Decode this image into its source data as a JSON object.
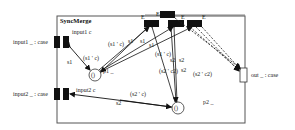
{
  "diagram": {
    "title": "SyncMerge",
    "ports": {
      "input1": {
        "outer_label": "input1 _ : case",
        "inner_label": "input1 c"
      },
      "input2": {
        "outer_label": "input2 _ : case",
        "inner_label": "input2 c"
      },
      "output": {
        "outer_label": "out _ : case"
      }
    },
    "places": [
      {
        "id": "p1",
        "label": "p1 _",
        "token": "()"
      },
      {
        "id": "p2",
        "label": "p2 _",
        "token": "()"
      }
    ],
    "transitions": [
      {
        "id": "t-top",
        "label": "E"
      },
      {
        "id": "t1",
        "label": "E"
      },
      {
        "id": "t2",
        "label": "E"
      },
      {
        "id": "t3",
        "label": "E"
      }
    ],
    "arc_labels": {
      "in1_s1": "s1",
      "in1_expr": "(s1 ' c)",
      "p1_t1_s1": "s1",
      "p1_t1_expr": "(s1 ' c)",
      "p1_t2_s1": "s1",
      "p1_t3_s1": "s1",
      "p1_t3_expr": "(s1 ' c)",
      "p2_t1_s2": "s2",
      "p2_t1_expr": "(s2 ' c2)",
      "p2_t2_s2": "s2",
      "p2_t3_s2": "s2",
      "p2_t3_expr": "(s2 ' c2)",
      "in2_s2": "s2",
      "in2_expr": "(s2 ' c)"
    }
  }
}
